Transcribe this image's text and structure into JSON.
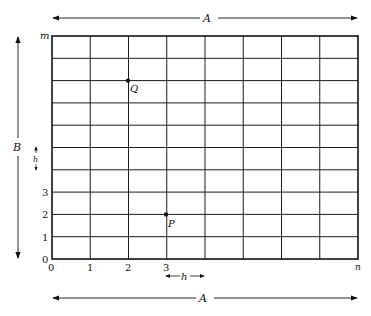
{
  "diagram": {
    "grid": {
      "columns": 8,
      "rows": 10,
      "left": 52,
      "top": 36,
      "right": 358,
      "bottom": 259,
      "line_color": "#1a1a1a"
    },
    "labels": {
      "top_dimension": "A",
      "bottom_dimension": "A",
      "side_dimension": "B",
      "row_spacing": "h",
      "col_spacing": "h",
      "y_axis_end": "m",
      "x_axis_end": "n"
    },
    "x_ticks": [
      "0",
      "1",
      "2",
      "3"
    ],
    "y_ticks": [
      "0",
      "1",
      "2",
      "3"
    ],
    "points": [
      {
        "name": "Q",
        "col": 2,
        "row_from_bottom": 8
      },
      {
        "name": "P",
        "col": 3,
        "row_from_bottom": 2
      }
    ]
  }
}
